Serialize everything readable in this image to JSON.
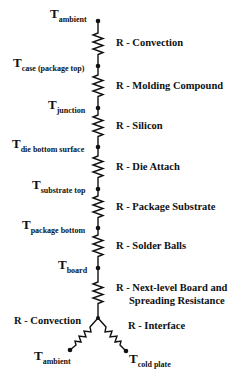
{
  "diagram": {
    "type": "thermal-resistance-network",
    "nodes": [
      {
        "id": "t-ambient-top",
        "symbol": "T",
        "subscript": "ambient"
      },
      {
        "id": "t-case",
        "symbol": "T",
        "subscript": "case (package top)"
      },
      {
        "id": "t-junction",
        "symbol": "T",
        "subscript": "junction"
      },
      {
        "id": "t-die-bottom",
        "symbol": "T",
        "subscript": "die bottom surface"
      },
      {
        "id": "t-substrate-top",
        "symbol": "T",
        "subscript": "substrate top"
      },
      {
        "id": "t-package-bottom",
        "symbol": "T",
        "subscript": "package bottom"
      },
      {
        "id": "t-board",
        "symbol": "T",
        "subscript": "board"
      },
      {
        "id": "t-ambient-bottom",
        "symbol": "T",
        "subscript": "ambient"
      },
      {
        "id": "t-cold-plate",
        "symbol": "T",
        "subscript": "cold plate"
      }
    ],
    "resistors": [
      {
        "id": "r-convection-top",
        "label": "R - Convection",
        "from": "t-ambient-top",
        "to": "t-case"
      },
      {
        "id": "r-molding",
        "label": "R - Molding Compound",
        "from": "t-case",
        "to": "t-junction"
      },
      {
        "id": "r-silicon",
        "label": "R - Silicon",
        "from": "t-junction",
        "to": "t-die-bottom"
      },
      {
        "id": "r-die-attach",
        "label": "R - Die Attach",
        "from": "t-die-bottom",
        "to": "t-substrate-top"
      },
      {
        "id": "r-substrate",
        "label": "R - Package Substrate",
        "from": "t-substrate-top",
        "to": "t-package-bottom"
      },
      {
        "id": "r-solder",
        "label": "R - Solder Balls",
        "from": "t-package-bottom",
        "to": "t-board"
      },
      {
        "id": "r-board",
        "label_line1": "R - Next-level Board and",
        "label_line2": "Spreading Resistance",
        "from": "t-board",
        "to": "junction-y"
      },
      {
        "id": "r-convection-bottom",
        "label": "R - Convection",
        "from": "junction-y",
        "to": "t-ambient-bottom"
      },
      {
        "id": "r-interface",
        "label": "R - Interface",
        "from": "junction-y",
        "to": "t-cold-plate"
      }
    ]
  }
}
